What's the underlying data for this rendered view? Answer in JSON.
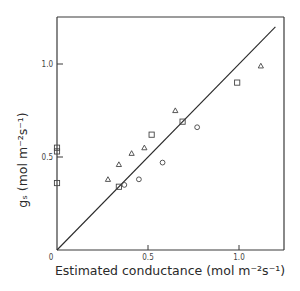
{
  "chart_data": {
    "type": "scatter",
    "title": "",
    "xlabel": "Estimated conductance (mol m⁻²s⁻¹)",
    "ylabel": "gₛ (mol m⁻²s⁻¹)",
    "xlim": [
      0,
      1.2
    ],
    "ylim": [
      0,
      1.2
    ],
    "x_ticks": [
      {
        "value": 0,
        "label": "0"
      },
      {
        "value": 0.5,
        "label": "0.5"
      },
      {
        "value": 1.0,
        "label": "1.0"
      }
    ],
    "y_ticks": [
      {
        "value": 0.5,
        "label": "0.5"
      },
      {
        "value": 1.0,
        "label": "1.0"
      }
    ],
    "grid": false,
    "legend": "none",
    "reference_line": {
      "name": "1:1 line",
      "from": [
        0,
        0
      ],
      "to": [
        1.2,
        1.2
      ]
    },
    "series": [
      {
        "name": "triangles",
        "marker": "triangle",
        "points": [
          [
            0.28,
            0.38
          ],
          [
            0.34,
            0.46
          ],
          [
            0.41,
            0.52
          ],
          [
            0.48,
            0.55
          ],
          [
            0.65,
            0.75
          ],
          [
            1.12,
            0.99
          ]
        ]
      },
      {
        "name": "squares",
        "marker": "square",
        "points": [
          [
            0.0,
            0.55
          ],
          [
            0.0,
            0.53
          ],
          [
            0.0,
            0.36
          ],
          [
            0.34,
            0.34
          ],
          [
            0.52,
            0.62
          ],
          [
            0.69,
            0.69
          ],
          [
            0.99,
            0.9
          ]
        ]
      },
      {
        "name": "circles",
        "marker": "circle",
        "points": [
          [
            0.37,
            0.35
          ],
          [
            0.45,
            0.38
          ],
          [
            0.58,
            0.47
          ],
          [
            0.77,
            0.66
          ]
        ]
      }
    ]
  }
}
